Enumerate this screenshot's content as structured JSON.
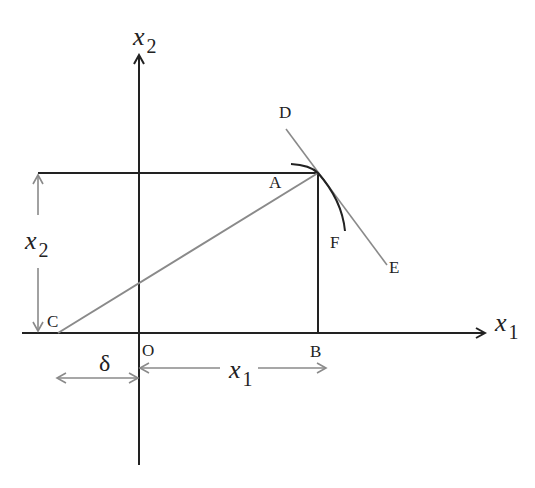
{
  "diagram": {
    "colors": {
      "axis": "#222222",
      "construction": "#8a8a8a",
      "background": "#ffffff"
    },
    "axes": {
      "x_axis_label": "x",
      "x_axis_subscript": "1",
      "y_axis_label": "x",
      "y_axis_subscript": "2"
    },
    "points": {
      "A": "A",
      "B": "B",
      "C": "C",
      "D": "D",
      "E": "E",
      "F": "F",
      "O": "O"
    },
    "dimensions": {
      "height_label": "x",
      "height_subscript": "2",
      "length_label": "x",
      "length_subscript": "1",
      "offset_label": "δ"
    }
  }
}
